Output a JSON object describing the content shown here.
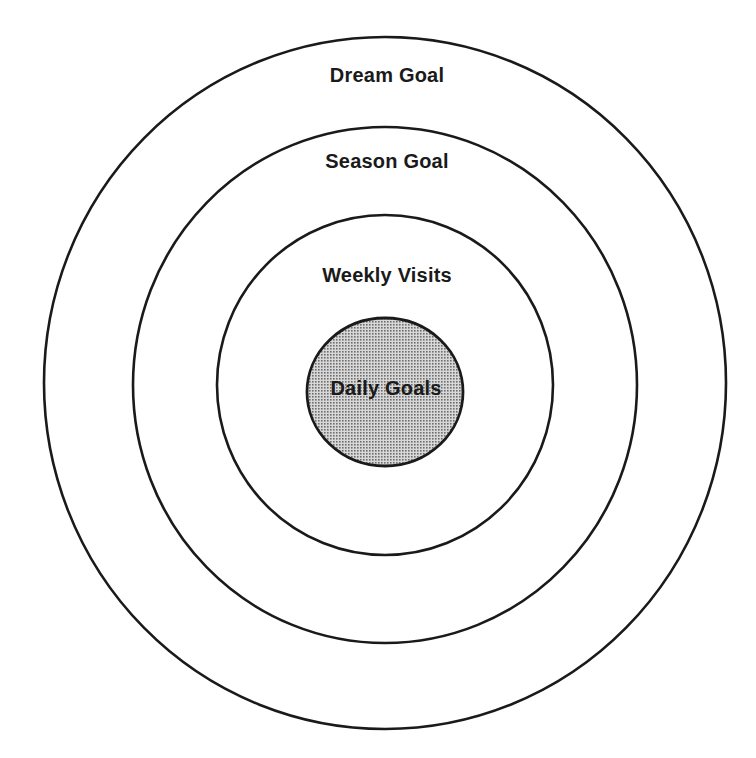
{
  "diagram": {
    "colors": {
      "stroke": "#1a1a1a",
      "background": "#ffffff",
      "inner_fill": "#cfcfcf",
      "inner_dot": "#777777"
    },
    "rings": [
      {
        "id": "dream",
        "label": "Dream Goal",
        "cx": 385,
        "cy": 383,
        "rx": 341,
        "ry": 346,
        "label_x": 387,
        "label_y": 64,
        "fill": "none"
      },
      {
        "id": "season",
        "label": "Season Goal",
        "cx": 385,
        "cy": 385,
        "rx": 252,
        "ry": 258,
        "label_x": 387,
        "label_y": 150,
        "fill": "none"
      },
      {
        "id": "weekly",
        "label": "Weekly Visits",
        "cx": 385,
        "cy": 385,
        "rx": 168,
        "ry": 170,
        "label_x": 387,
        "label_y": 264,
        "fill": "none"
      },
      {
        "id": "daily",
        "label": "Daily Goals",
        "cx": 385,
        "cy": 392,
        "rx": 78,
        "ry": 74,
        "label_x": 386,
        "label_y": 377,
        "fill": "dotted"
      }
    ]
  }
}
